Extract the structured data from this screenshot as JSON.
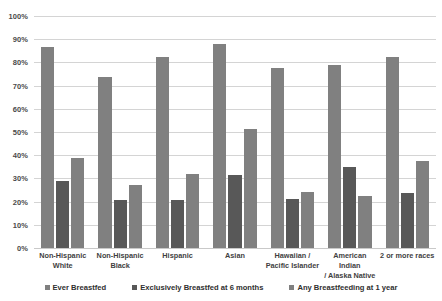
{
  "chart_data": {
    "type": "bar",
    "title": "",
    "xlabel": "",
    "ylabel": "",
    "ylim": [
      0,
      100
    ],
    "ytick_labels": [
      "100%",
      "90%",
      "80%",
      "70%",
      "60%",
      "50%",
      "40%",
      "30%",
      "20%",
      "10%",
      "0%"
    ],
    "ytick_values": [
      100,
      90,
      80,
      70,
      60,
      50,
      40,
      30,
      20,
      10,
      0
    ],
    "grid": true,
    "legend_position": "bottom",
    "categories": [
      {
        "line1": "Non-Hispanic",
        "line2": "White"
      },
      {
        "line1": "Non-Hispanic",
        "line2": "Black"
      },
      {
        "line1": "Hispanic",
        "line2": ""
      },
      {
        "line1": "Asian",
        "line2": ""
      },
      {
        "line1": "Hawaiian /",
        "line2": "Pacific Islander"
      },
      {
        "line1": "American Indian",
        "line2": "/ Alaska Native"
      },
      {
        "line1": "2 or more races",
        "line2": ""
      }
    ],
    "series": [
      {
        "name": "Ever Breastfed",
        "color": "#808080",
        "values": [
          86.5,
          73.5,
          82.5,
          88.0,
          77.5,
          79.0,
          82.5
        ]
      },
      {
        "name": "Exclusively Breastfed at 6 months",
        "color": "#585858",
        "values": [
          29.0,
          20.5,
          20.5,
          31.5,
          21.0,
          35.0,
          23.5
        ]
      },
      {
        "name": "Any Breastfeeding at 1 year",
        "color": "#808080",
        "values": [
          39.0,
          27.0,
          32.0,
          51.5,
          24.0,
          22.5,
          37.5
        ]
      }
    ]
  }
}
